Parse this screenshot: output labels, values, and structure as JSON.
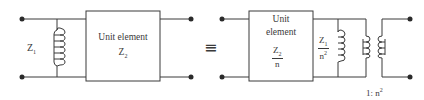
{
  "diagram": {
    "type": "circuit-equivalence",
    "colors": {
      "line": "#3a3a3a",
      "background": "#ffffff"
    },
    "left_circuit": {
      "shunt_element": {
        "symbol": "Z",
        "subscript": "1",
        "kind": "inductor"
      },
      "unit_element": {
        "line1": "Unit element",
        "symbol": "Z",
        "subscript": "2"
      }
    },
    "equivalence_symbol": "≡",
    "right_circuit": {
      "unit_element": {
        "line1": "Unit",
        "line2": "element",
        "numerator_symbol": "Z",
        "numerator_subscript": "2",
        "denominator": "n"
      },
      "shunt_element": {
        "numerator_symbol": "Z",
        "numerator_subscript": "1",
        "denominator_base": "n",
        "denominator_power": "2",
        "kind": "inductor"
      },
      "transformer": {
        "ratio_prefix": "1: n",
        "ratio_power": "2"
      }
    }
  }
}
